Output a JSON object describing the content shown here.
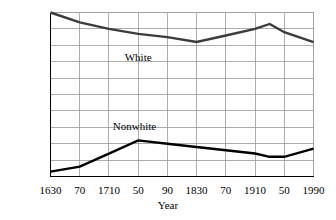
{
  "chart_data": {
    "type": "line",
    "title": "",
    "xlabel": "Year",
    "ylabel": "",
    "x": [
      1630,
      1670,
      1710,
      1750,
      1790,
      1830,
      1870,
      1910,
      1930,
      1950,
      1990
    ],
    "xlim": [
      1630,
      1990
    ],
    "ylim": [
      0,
      100
    ],
    "grid": true,
    "legend_position": "inline-annotation",
    "x_tick_labels": [
      "1630",
      "70",
      "1710",
      "50",
      "90",
      "1830",
      "70",
      "1910",
      "50",
      "1990"
    ],
    "x_tick_values": [
      1630,
      1670,
      1710,
      1750,
      1790,
      1830,
      1870,
      1910,
      1950,
      1990
    ],
    "y_tick_labels": [
      "100%",
      "90",
      "80",
      "70",
      "60",
      "50",
      "40",
      "30",
      "20",
      "10",
      "0"
    ],
    "y_tick_values": [
      100,
      90,
      80,
      70,
      60,
      50,
      40,
      30,
      20,
      10,
      0
    ],
    "series": [
      {
        "name": "White",
        "color": "#3c3c3c",
        "values": [
          100,
          94,
          90,
          87,
          85,
          82,
          86,
          90,
          93,
          88,
          82
        ]
      },
      {
        "name": "Nonwhite",
        "color": "#000000",
        "values": [
          3,
          6,
          14,
          22,
          20,
          18,
          16,
          14,
          12,
          12,
          17
        ]
      }
    ],
    "annotations": [
      {
        "text": "White",
        "x": 1750,
        "y": 72
      },
      {
        "text": "Nonwhite",
        "x": 1745,
        "y": 30
      }
    ]
  },
  "axes": {
    "x_title": "Year"
  },
  "colors": {
    "grid": "#999999",
    "axis": "#000000",
    "background": "#ffffff",
    "white_series": "#3c3c3c",
    "nonwhite_series": "#000000"
  }
}
